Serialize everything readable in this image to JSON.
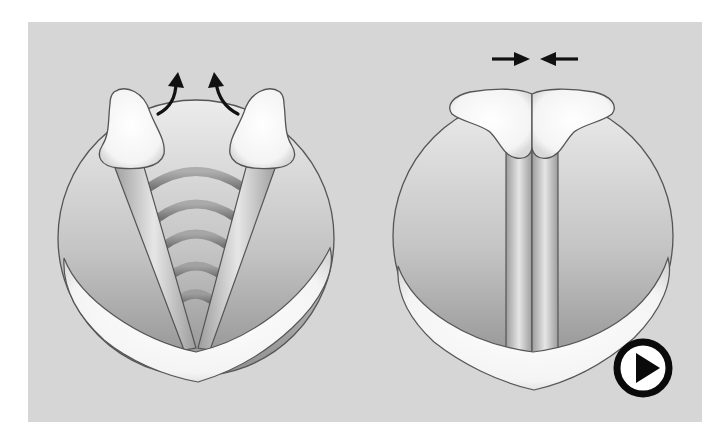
{
  "figure": {
    "background_color": "#d6d6d6",
    "panel_bounds": {
      "x": 28,
      "y": 22,
      "width": 674,
      "height": 400
    },
    "panels": [
      {
        "id": "left",
        "state": "open (abducted) vocal folds",
        "arrows": [
          "curved-arrow-up-left",
          "curved-arrow-up-right"
        ],
        "sound_waves": 5
      },
      {
        "id": "right",
        "state": "closed (adducted) vocal folds",
        "arrows": [
          "arrow-right",
          "arrow-left"
        ]
      }
    ],
    "colors": {
      "circle_fill_top": "#e8e8e8",
      "circle_fill_bottom": "#9a9a9a",
      "outline": "#555555",
      "cartilage_fill": "#fbfbfb",
      "wave": "#8c8c8c",
      "arrow": "#111111"
    }
  },
  "controls": {
    "play_button": {
      "icon": "play-icon",
      "label": ""
    }
  }
}
